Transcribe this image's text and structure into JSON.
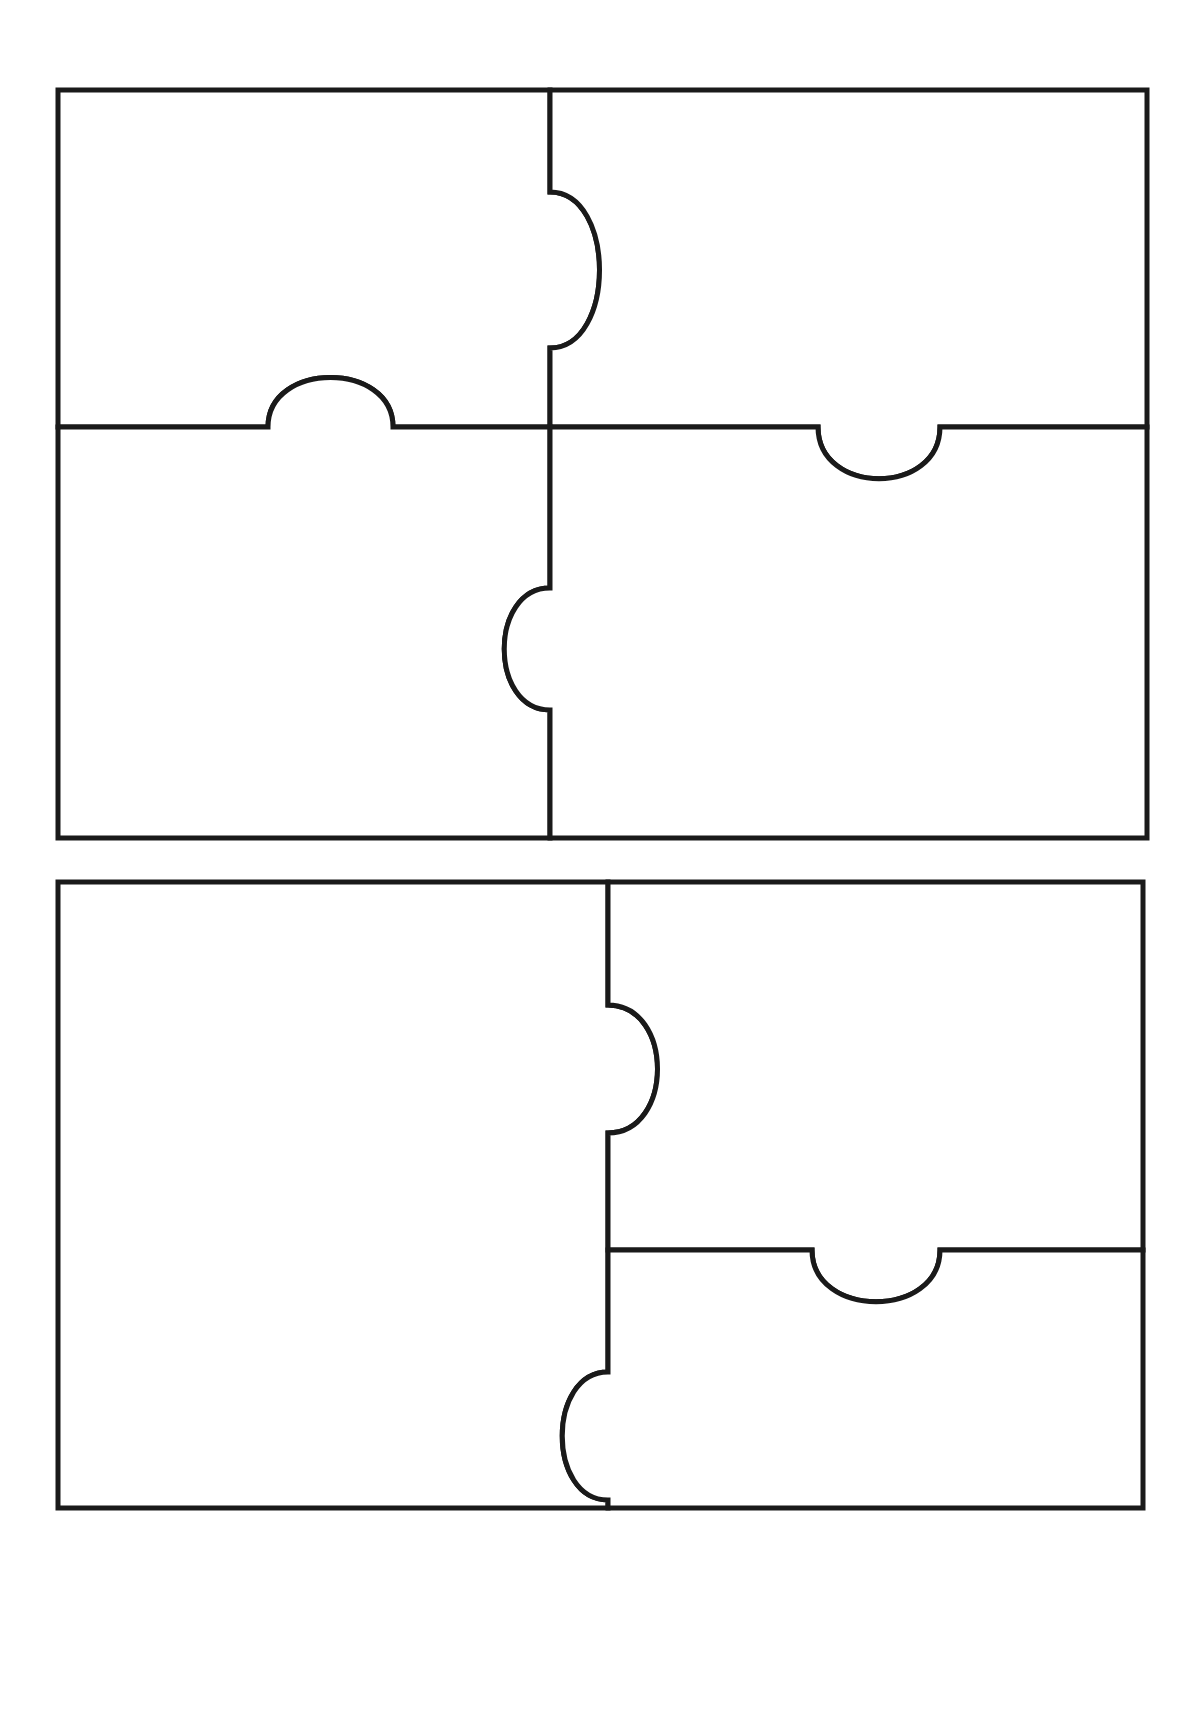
{
  "page": {
    "background_color": "#ffffff",
    "width": 1204,
    "height": 1717
  },
  "style": {
    "outline_color": "#1a1a1a",
    "fill_color": "#ffffff",
    "stroke_width": 5
  },
  "puzzles": [
    {
      "name": "upper-puzzle",
      "label": "Top four-piece jigsaw puzzle",
      "bounds": {
        "x": 58,
        "y": 90,
        "width": 1089,
        "height": 748
      },
      "vertical_divider_x": 550,
      "horizontal_divider_y": 427,
      "pieces": [
        {
          "name": "top-left-piece",
          "label": "Top-left puzzle piece",
          "path": "M 58 90 L 550 90 L 550 192 C 616 192 616 348 550 348 L 550 427 L 393 427 C 393 361 268 361 268 427 L 58 427 Z"
        },
        {
          "name": "top-right-piece",
          "label": "Top-right puzzle piece",
          "path": "M 550 90 L 1147 90 L 1147 427 L 940 427 C 940 496 818 496 818 427 L 550 427 L 550 348 C 616 348 616 192 550 192 Z"
        },
        {
          "name": "bottom-left-piece",
          "label": "Bottom-left puzzle piece",
          "path": "M 58 427 L 268 427 C 268 361 393 361 393 427 L 550 427 L 550 588 C 489 588 489 710 550 710 L 550 838 L 58 838 Z"
        },
        {
          "name": "bottom-right-piece",
          "label": "Bottom-right puzzle piece",
          "path": "M 550 427 L 818 427 C 818 496 940 496 940 427 L 1147 427 L 1147 838 L 550 838 L 550 710 C 489 710 489 588 550 588 Z"
        }
      ],
      "connectors": [
        {
          "name": "tab-right-upper-vertical",
          "type": "tab",
          "direction": "right",
          "on": "vertical-divider",
          "span": [
            192,
            348
          ],
          "depth": 66
        },
        {
          "name": "tab-up-upper-horizontal",
          "type": "tab",
          "direction": "up",
          "on": "horizontal-divider",
          "span": [
            268,
            393
          ],
          "depth": 66
        },
        {
          "name": "blank-down-upper-horizontal",
          "type": "blank",
          "direction": "down",
          "on": "horizontal-divider",
          "span": [
            818,
            940
          ],
          "depth": 69
        },
        {
          "name": "blank-left-upper-vertical",
          "type": "blank",
          "direction": "left",
          "on": "vertical-divider",
          "span": [
            588,
            710
          ],
          "depth": 61
        }
      ]
    },
    {
      "name": "lower-puzzle",
      "label": "Bottom four-piece jigsaw puzzle",
      "bounds": {
        "x": 58,
        "y": 882,
        "width": 1085,
        "height": 626
      },
      "vertical_divider_x": 608,
      "horizontal_divider_y": 1250,
      "pieces": [
        {
          "name": "left-piece",
          "label": "Left puzzle piece (full height)",
          "path": "M 58 882 L 608 882 L 608 1005 C 674 1005 674 1133 608 1133 L 608 1372 C 547 1372 547 1500 608 1500 L 608 1508 L 58 1508 Z"
        },
        {
          "name": "top-right-piece",
          "label": "Top-right puzzle piece",
          "path": "M 608 882 L 1143 882 L 1143 1250 L 940 1250 C 940 1319 812 1319 812 1250 L 608 1250 L 608 1133 C 674 1133 674 1005 608 1005 Z"
        },
        {
          "name": "bottom-right-piece",
          "label": "Bottom-right puzzle piece",
          "path": "M 608 1250 L 812 1250 C 812 1319 940 1319 940 1250 L 1143 1250 L 1143 1508 L 608 1508 L 608 1500 C 547 1500 547 1372 608 1372 Z"
        }
      ],
      "connectors": [
        {
          "name": "tab-right-lower-vertical",
          "type": "tab",
          "direction": "right",
          "on": "vertical-divider",
          "span": [
            1005,
            1133
          ],
          "depth": 66
        },
        {
          "name": "blank-down-lower-horizontal",
          "type": "blank",
          "direction": "down",
          "on": "horizontal-divider",
          "span": [
            812,
            940
          ],
          "depth": 69
        },
        {
          "name": "blank-left-lower-vertical",
          "type": "blank",
          "direction": "left",
          "on": "vertical-divider",
          "span": [
            1372,
            1500
          ],
          "depth": 61
        }
      ]
    }
  ]
}
